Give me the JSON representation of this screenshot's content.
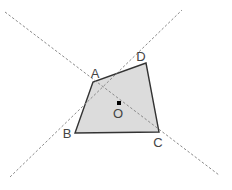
{
  "diagram": {
    "type": "geometry",
    "colors": {
      "fill": "#dcdcdc",
      "stroke": "#333333",
      "dashed": "#8a8a8a",
      "label": "#444444",
      "point": "#000000"
    },
    "vertices": [
      {
        "name": "A",
        "label": "A",
        "x": 93,
        "y": 82,
        "lx": 95,
        "ly": 78
      },
      {
        "name": "B",
        "label": "B",
        "x": 75,
        "y": 133,
        "lx": 67,
        "ly": 138
      },
      {
        "name": "C",
        "label": "C",
        "x": 159,
        "y": 132,
        "lx": 158,
        "ly": 147
      },
      {
        "name": "D",
        "label": "D",
        "x": 146,
        "y": 63,
        "lx": 141,
        "ly": 61
      }
    ],
    "center": {
      "name": "O",
      "label": "O",
      "x": 119,
      "y": 103,
      "lx": 118,
      "ly": 118
    },
    "extended_lines": [
      {
        "name": "line-AC",
        "x1": 5,
        "y1": 12,
        "x2": 219,
        "y2": 175
      },
      {
        "name": "line-BD",
        "x1": 10,
        "y1": 177,
        "x2": 182,
        "y2": 10
      }
    ]
  }
}
